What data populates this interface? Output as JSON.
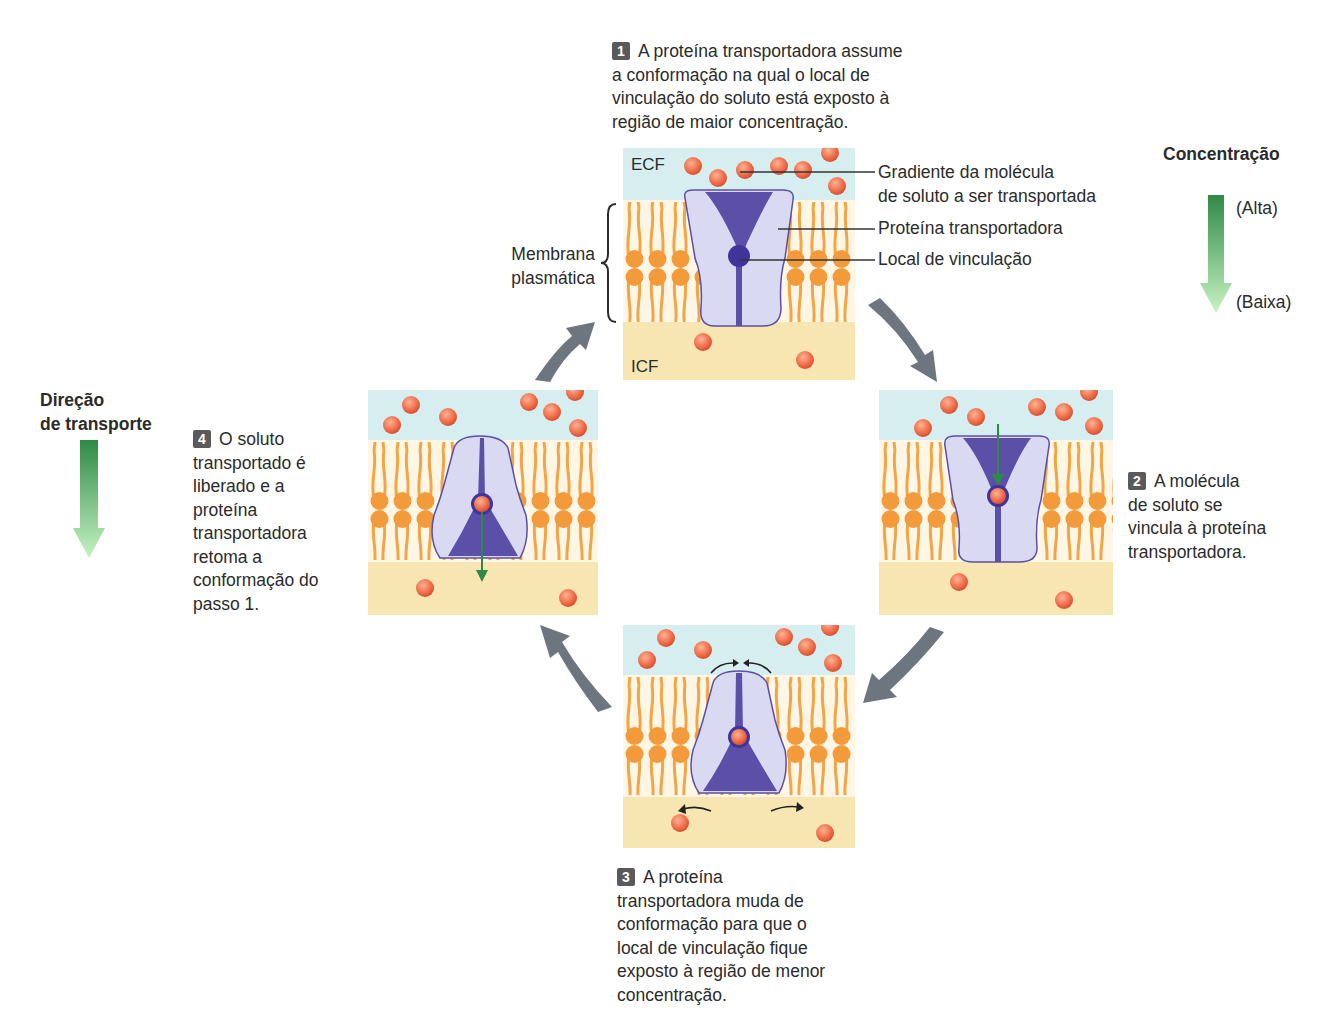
{
  "steps": [
    {
      "number": "1",
      "text_lines": [
        "A proteína transportadora assume",
        "a conformação na qual o local de",
        "vinculação do soluto está exposto à",
        "região de maior concentração."
      ]
    },
    {
      "number": "2",
      "text_lines": [
        "A molécula",
        "de soluto se",
        "vincula à proteína",
        "transportadora."
      ]
    },
    {
      "number": "3",
      "text_lines": [
        "A proteína",
        "transportadora muda de",
        "conformação para que o",
        "local de vinculação fique",
        "exposto à região de menor",
        "concentração."
      ]
    },
    {
      "number": "4",
      "text_lines": [
        "O soluto",
        "transportado é",
        "liberado e a",
        "proteína",
        "transportadora",
        "retoma a",
        "conformação do",
        "passo 1."
      ]
    }
  ],
  "regions": {
    "ecf": "ECF",
    "icf": "ICF"
  },
  "membrane_label": [
    "Membrana",
    "plasmática"
  ],
  "callouts": {
    "gradient": [
      "Gradiente da molécula",
      "de soluto a ser transportada"
    ],
    "carrier": "Proteína transportadora",
    "binding_site": "Local de vinculação"
  },
  "concentration_legend": {
    "title": "Concentração",
    "high": "(Alta)",
    "low": "(Baixa)"
  },
  "transport_direction": {
    "title_lines": [
      "Direção",
      "de transporte"
    ]
  },
  "colors": {
    "ecf": "#d6eef0",
    "icf": "#f8e6b2",
    "lipid": "#f2a040",
    "protein_light": "#d8d8f0",
    "protein_dark": "#5b4fa8",
    "solute": "#f07048",
    "cycle_arrow": "#6d767e",
    "gradient_dark": "#2f8f45",
    "gradient_light": "#b8f0b8",
    "step_badge": "#5a5a5a"
  }
}
